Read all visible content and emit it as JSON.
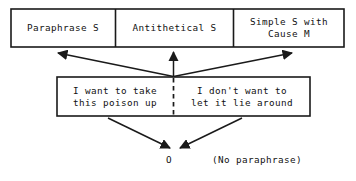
{
  "diagram": {
    "stroke_color": "#1a1a1a",
    "background_color": "#ffffff",
    "categories": [
      {
        "id": "paraphrase",
        "label": "Paraphrase S"
      },
      {
        "id": "antithetical",
        "label": "Antithetical S"
      },
      {
        "id": "simple_cause",
        "label": "Simple S with\nCause M"
      }
    ],
    "clauses": [
      {
        "id": "left",
        "text": "I want to take\nthis poison up"
      },
      {
        "id": "right",
        "text": "I don't want to\nlet it lie around"
      }
    ],
    "outcome": {
      "symbol": "O",
      "note": "(No paraphrase)"
    },
    "edges": [
      {
        "id": "to-paraphrase",
        "from": "clause-junction",
        "to": "paraphrase",
        "style": "solid",
        "arrowhead": "end"
      },
      {
        "id": "to-antithetical",
        "from": "clause-junction",
        "to": "antithetical",
        "style": "solid",
        "arrowhead": "end"
      },
      {
        "id": "to-simple-cause",
        "from": "clause-junction",
        "to": "simple_cause",
        "style": "solid",
        "arrowhead": "end"
      },
      {
        "id": "clause-divider",
        "from": "clause-junction",
        "to": "clause-box-bottom",
        "style": "dashed",
        "arrowhead": "none"
      },
      {
        "id": "left-to-outcome",
        "from": "left",
        "to": "outcome",
        "style": "solid",
        "arrowhead": "end"
      },
      {
        "id": "right-to-outcome",
        "from": "right",
        "to": "outcome",
        "style": "solid",
        "arrowhead": "end"
      }
    ]
  }
}
